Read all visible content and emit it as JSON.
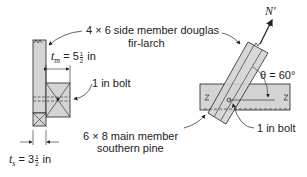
{
  "labels": {
    "side_member": "4 × 6 side member douglas",
    "side_member_2": "fir-larch",
    "tm_var": "t",
    "tm_sub": "m",
    "tm_eq": " = 5",
    "tm_num": "1",
    "tm_den": "2",
    "tm_unit": " in",
    "bolt_left": "1 in bolt",
    "main_member": "6 × 8 main member",
    "main_member_2": "southern pine",
    "ts_var": "t",
    "ts_sub": "s",
    "ts_eq": " = 3",
    "ts_num": "1",
    "ts_den": "2",
    "ts_unit": " in",
    "force": "N′",
    "angle": "θ = 60°",
    "bolt_right": "1 in bolt"
  },
  "colors": {
    "member_fill": "#d4d4d4",
    "line": "#222222"
  }
}
